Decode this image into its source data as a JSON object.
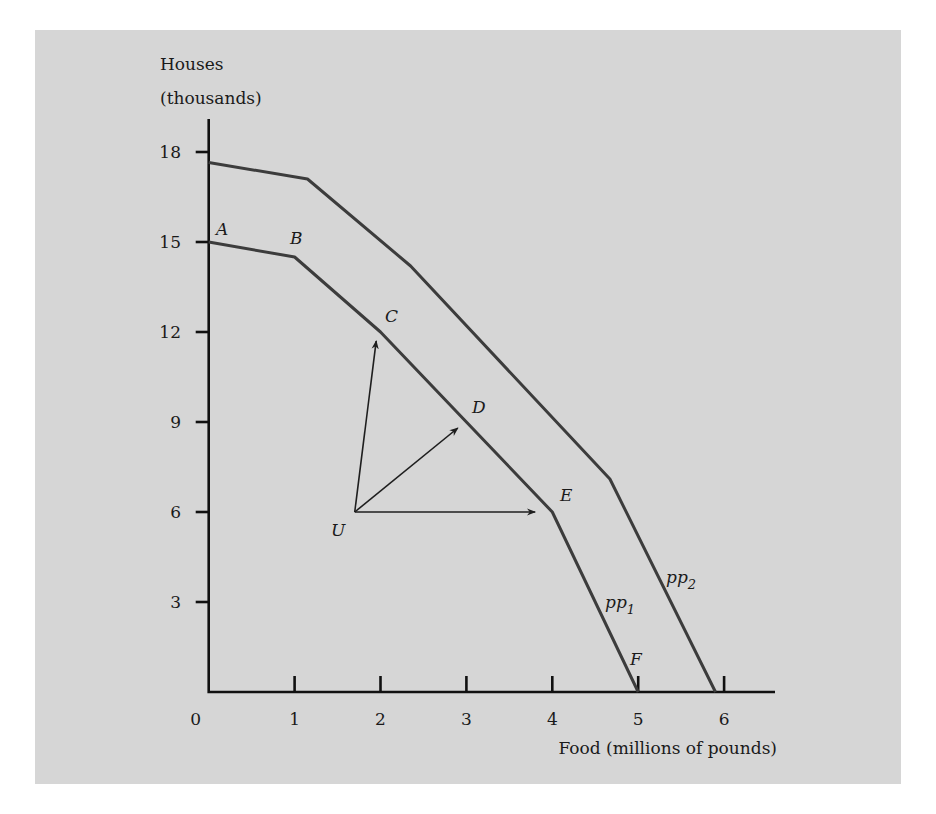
{
  "chart_data": {
    "type": "line",
    "title": "",
    "xlabel": "Food (millions of pounds)",
    "ylabel_line1": "Houses",
    "ylabel_line2": "(thousands)",
    "xlim": [
      0,
      6.6
    ],
    "ylim": [
      0,
      19
    ],
    "x_ticks": [
      0,
      1,
      2,
      3,
      4,
      5,
      6
    ],
    "x_tick_labels": [
      "0",
      "1",
      "2",
      "3",
      "4",
      "5",
      "6"
    ],
    "y_ticks": [
      3,
      6,
      9,
      12,
      15,
      18
    ],
    "y_tick_labels": [
      "3",
      "6",
      "9",
      "12",
      "15",
      "18"
    ],
    "grid": false,
    "legend": "none (curves labeled inline)",
    "series": [
      {
        "name": "pp1",
        "label_base": "pp",
        "label_sub": "1",
        "points": [
          {
            "label": "A",
            "x": 0,
            "y": 15
          },
          {
            "label": "B",
            "x": 1,
            "y": 14.5
          },
          {
            "label": "C",
            "x": 2,
            "y": 12
          },
          {
            "label": "D",
            "x": 3,
            "y": 9
          },
          {
            "label": "E",
            "x": 4,
            "y": 6
          },
          {
            "label": "F",
            "x": 5,
            "y": 0
          }
        ]
      },
      {
        "name": "pp2",
        "label_base": "pp",
        "label_sub": "2",
        "points": [
          {
            "x": 0,
            "y": 17.65
          },
          {
            "x": 1.15,
            "y": 17.1
          },
          {
            "x": 2.35,
            "y": 14.2
          },
          {
            "x": 4.67,
            "y": 7.1
          },
          {
            "x": 5.9,
            "y": 0
          }
        ]
      }
    ],
    "annotations": {
      "point_U": {
        "label": "U",
        "x": 1.7,
        "y": 6
      },
      "arrows_from_U": [
        {
          "to_x": 1.95,
          "to_y": 11.7
        },
        {
          "to_x": 2.9,
          "to_y": 8.8
        },
        {
          "to_x": 3.8,
          "to_y": 6
        }
      ]
    }
  },
  "labels": {
    "A": "A",
    "B": "B",
    "C": "C",
    "D": "D",
    "E": "E",
    "F": "F",
    "U": "U",
    "pp": "pp",
    "sub1": "1",
    "sub2": "2"
  }
}
